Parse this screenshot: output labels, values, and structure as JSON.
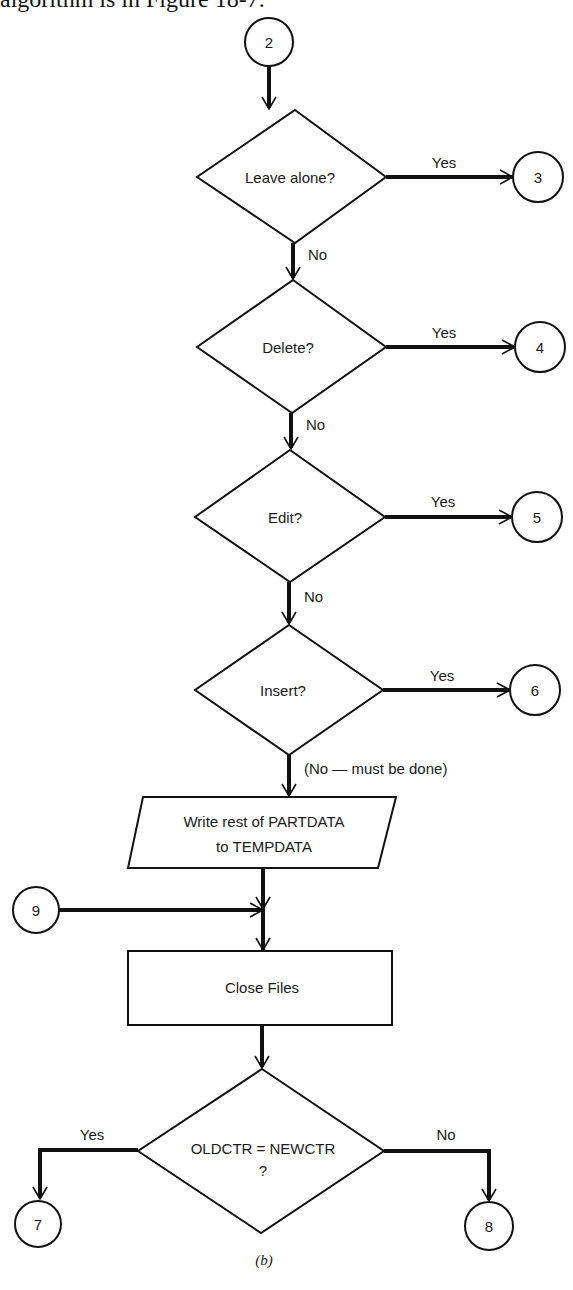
{
  "header": {
    "text": "algorithm is in Figure 18-7."
  },
  "caption": "(b)",
  "connectors": {
    "c2": "2",
    "c3": "3",
    "c4": "4",
    "c5": "5",
    "c6": "6",
    "c7": "7",
    "c8": "8",
    "c9": "9"
  },
  "decisions": {
    "leave_alone": "Leave alone?",
    "delete": "Delete?",
    "edit": "Edit?",
    "insert": "Insert?",
    "compare_line1": "OLDCTR = NEWCTR",
    "compare_line2": "?"
  },
  "io": {
    "write_line1": "Write rest of PARTDATA",
    "write_line2": "to TEMPDATA"
  },
  "process": {
    "close_files": "Close Files"
  },
  "labels": {
    "yes": "Yes",
    "no": "No",
    "no_must_be_done": "(No — must be done)"
  },
  "colors": {
    "ink": "#111111",
    "background": "#ffffff"
  }
}
